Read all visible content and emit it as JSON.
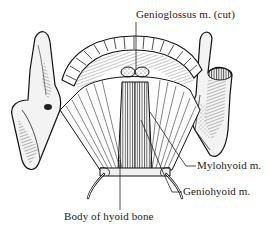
{
  "figure": {
    "labels": {
      "genioglossus": "Genioglossus m. (cut)",
      "mylohyoid": "Mylohyoid m.",
      "geniohyoid": "Geniohyoid m.",
      "hyoid_body": "Body of hyoid bone"
    },
    "colors": {
      "ink": "#1a1a1a",
      "paper": "#ffffff",
      "bone_shade": "#e8e8e8"
    }
  }
}
